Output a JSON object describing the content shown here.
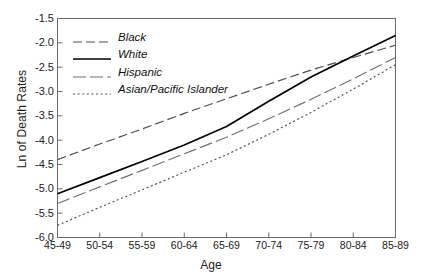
{
  "chart_data": {
    "type": "line",
    "title": "",
    "xlabel": "Age",
    "ylabel": "Ln of Death Rates",
    "categories": [
      "45-49",
      "50-54",
      "55-59",
      "60-64",
      "65-69",
      "70-74",
      "75-79",
      "80-84",
      "85-89"
    ],
    "ylim": [
      -6.0,
      -1.5
    ],
    "yticks": [
      "-1.5",
      "-2.0",
      "-2.5",
      "-3.0",
      "-3.5",
      "-4.0",
      "-4.5",
      "-5.0",
      "-5.5",
      "-6.0"
    ],
    "ytick_values": [
      -1.5,
      -2.0,
      -2.5,
      -3.0,
      -3.5,
      -4.0,
      -4.5,
      -5.0,
      -5.5,
      -6.0
    ],
    "grid": false,
    "legend_position": "upper-left",
    "series": [
      {
        "name": "Black",
        "style": "dashed",
        "color": "#4d4d4d",
        "values": [
          -4.4,
          -4.08,
          -3.77,
          -3.45,
          -3.15,
          -2.85,
          -2.56,
          -2.3,
          -2.05
        ]
      },
      {
        "name": "White",
        "style": "solid",
        "color": "#000000",
        "values": [
          -5.1,
          -4.77,
          -4.44,
          -4.1,
          -3.72,
          -3.2,
          -2.7,
          -2.27,
          -1.85
        ]
      },
      {
        "name": "Hispanic",
        "style": "long-dash",
        "color": "#6e6e6e",
        "values": [
          -5.3,
          -4.96,
          -4.62,
          -4.28,
          -3.94,
          -3.56,
          -3.16,
          -2.74,
          -2.3
        ]
      },
      {
        "name": "Asian/Pacific Islander",
        "style": "dotted",
        "color": "#4d4d4d",
        "values": [
          -5.75,
          -5.38,
          -5.02,
          -4.66,
          -4.3,
          -3.88,
          -3.43,
          -2.95,
          -2.45
        ]
      }
    ]
  },
  "axes": {
    "x_title": "Age",
    "y_title": "Ln of Death Rates"
  },
  "legend": {
    "items": [
      {
        "label": "Black"
      },
      {
        "label": "White"
      },
      {
        "label": "Hispanic"
      },
      {
        "label": "Asian/Pacific Islander"
      }
    ]
  }
}
